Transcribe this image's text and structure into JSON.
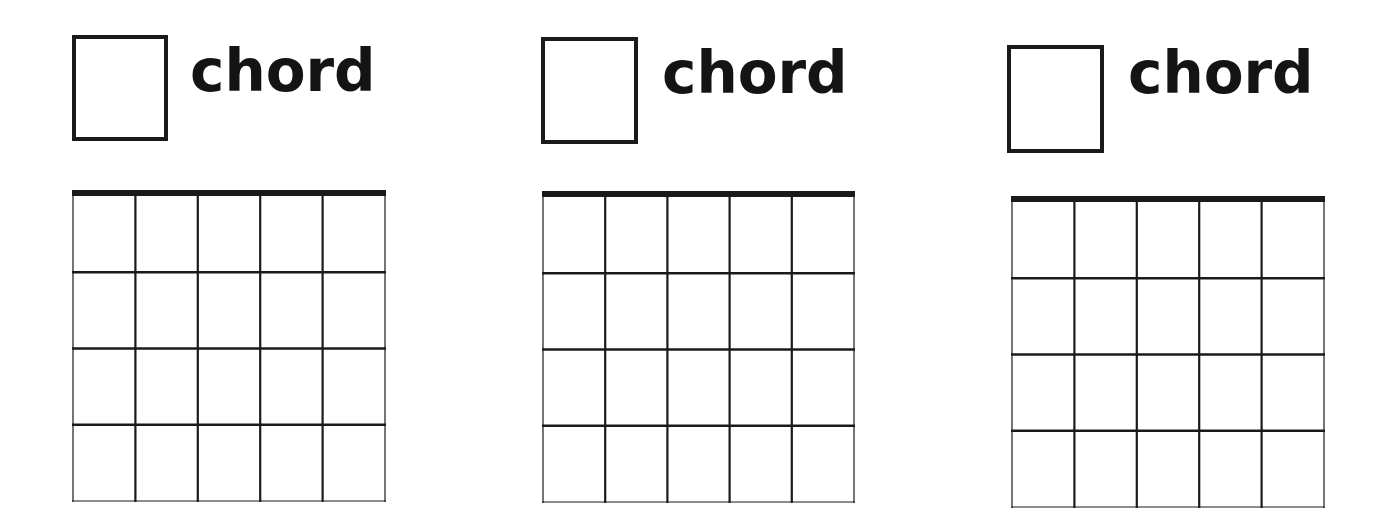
{
  "page": {
    "background": "#ffffff",
    "line_color": "#1a1a1a"
  },
  "diagrams": [
    {
      "label": "chord",
      "name_box": {
        "x": 72,
        "y": 35,
        "w": 96,
        "h": 106
      },
      "label_pos": {
        "x": 190,
        "y": 42
      },
      "grid": {
        "x": 72,
        "y": 190,
        "w": 314,
        "h": 312,
        "strings": 6,
        "frets": 4,
        "nut_thickness": 6
      }
    },
    {
      "label": "chord",
      "name_box": {
        "x": 541,
        "y": 37,
        "w": 97,
        "h": 107
      },
      "label_pos": {
        "x": 662,
        "y": 44
      },
      "grid": {
        "x": 542,
        "y": 191,
        "w": 313,
        "h": 312,
        "strings": 6,
        "frets": 4,
        "nut_thickness": 6
      }
    },
    {
      "label": "chord",
      "name_box": {
        "x": 1007,
        "y": 45,
        "w": 97,
        "h": 108
      },
      "label_pos": {
        "x": 1128,
        "y": 44
      },
      "grid": {
        "x": 1011,
        "y": 196,
        "w": 314,
        "h": 312,
        "strings": 6,
        "frets": 4,
        "nut_thickness": 6
      }
    }
  ]
}
